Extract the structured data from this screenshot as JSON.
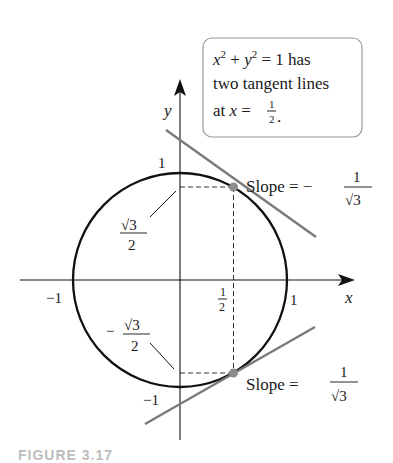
{
  "figure": {
    "caption_partial": "FIGURE 3.17",
    "callout": {
      "line1_eq": "x² + y² = 1 has",
      "line2": "two tangent lines",
      "line3_prefix": "at x =",
      "line3_frac_num": "1",
      "line3_frac_den": "2",
      "line3_suffix": "."
    },
    "axes": {
      "x_label": "x",
      "y_label": "y",
      "x_ticks": [
        "−1",
        "1/2",
        "1"
      ],
      "y_ticks": [
        "1",
        "−1"
      ]
    },
    "labels": {
      "sqrt3_over_2_num": "√3",
      "sqrt3_over_2_den": "2",
      "neg_sign": "−",
      "slope_top_text": "Slope = −",
      "slope_top_num": "1",
      "slope_top_den": "√3",
      "slope_bottom_text": "Slope =",
      "slope_bottom_num": "1",
      "slope_bottom_den": "√3",
      "half_num": "1",
      "half_den": "2",
      "one_x": "1",
      "neg_one_x": "−1",
      "one_y": "1",
      "neg_one_y": "−1"
    },
    "colors": {
      "curve": "#111111",
      "tangent": "#7a7a7a",
      "point": "#8c8c8c",
      "box_border": "#9a9a9a"
    }
  }
}
